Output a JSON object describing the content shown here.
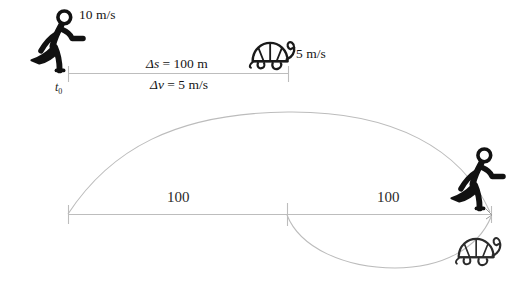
{
  "diagram": {
    "colors": {
      "figure_stroke": "#111111",
      "figure_stroke_light": "#3a3a3a",
      "axis_line": "#b9b9b9",
      "arc_line": "#b6b6b6",
      "text": "#151515"
    },
    "top_scene": {
      "runner_speed_label": "10 m/s",
      "turtle_speed_label": "5 m/s",
      "start_time_label": "t",
      "start_time_subscript": "0",
      "gap_label": "Δs = 100 m",
      "gap_label_delta": "Δ",
      "gap_label_var": "s",
      "gap_label_value": " = 100 m",
      "relative_speed_delta": "Δ",
      "relative_speed_var": "v",
      "relative_speed_value": " = 5 m/s",
      "relative_speed_label": "Δv = 5 m/s"
    },
    "bottom_scene": {
      "left_segment_label": "100",
      "right_segment_label": "100"
    },
    "icons": {
      "runner_top": "running-person-icon",
      "runner_bottom": "running-person-icon",
      "turtle_top": "turtle-icon",
      "turtle_bottom": "turtle-icon"
    }
  }
}
